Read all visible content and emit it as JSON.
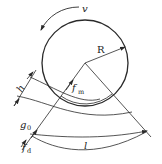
{
  "diagram": {
    "type": "roll-bite geometry",
    "colors": {
      "line": "#2a2a2a",
      "background": "#ffffff"
    },
    "labels": {
      "velocity": "v",
      "radius": "R",
      "thickness": "h",
      "gap": "g",
      "gap_sub": "0",
      "contact_force": "f",
      "contact_force_sub": "m",
      "die_force": "f",
      "die_force_sub": "d",
      "length": "l"
    },
    "elements": [
      "roll-circle",
      "velocity-arrow",
      "radius-arrow",
      "left-radial-line",
      "right-radial-line",
      "fm-arc",
      "h-arcs",
      "g0-dimension",
      "fd-dimension",
      "l-arc-dimension"
    ]
  }
}
